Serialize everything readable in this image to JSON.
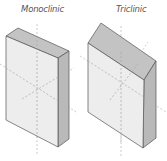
{
  "labels": {
    "monoclinic": "Monoclinic",
    "triclinic": "Triclinic"
  },
  "colors": {
    "front_face": "#ebebeb",
    "top_face": "#c3c3c3",
    "side_face": "#b9b9b9",
    "edge": "#555555",
    "axis": "#b0b0b0",
    "label": "#555555"
  },
  "figures": [
    {
      "name": "monoclinic",
      "label": "Monoclinic"
    },
    {
      "name": "triclinic",
      "label": "Triclinic"
    }
  ]
}
